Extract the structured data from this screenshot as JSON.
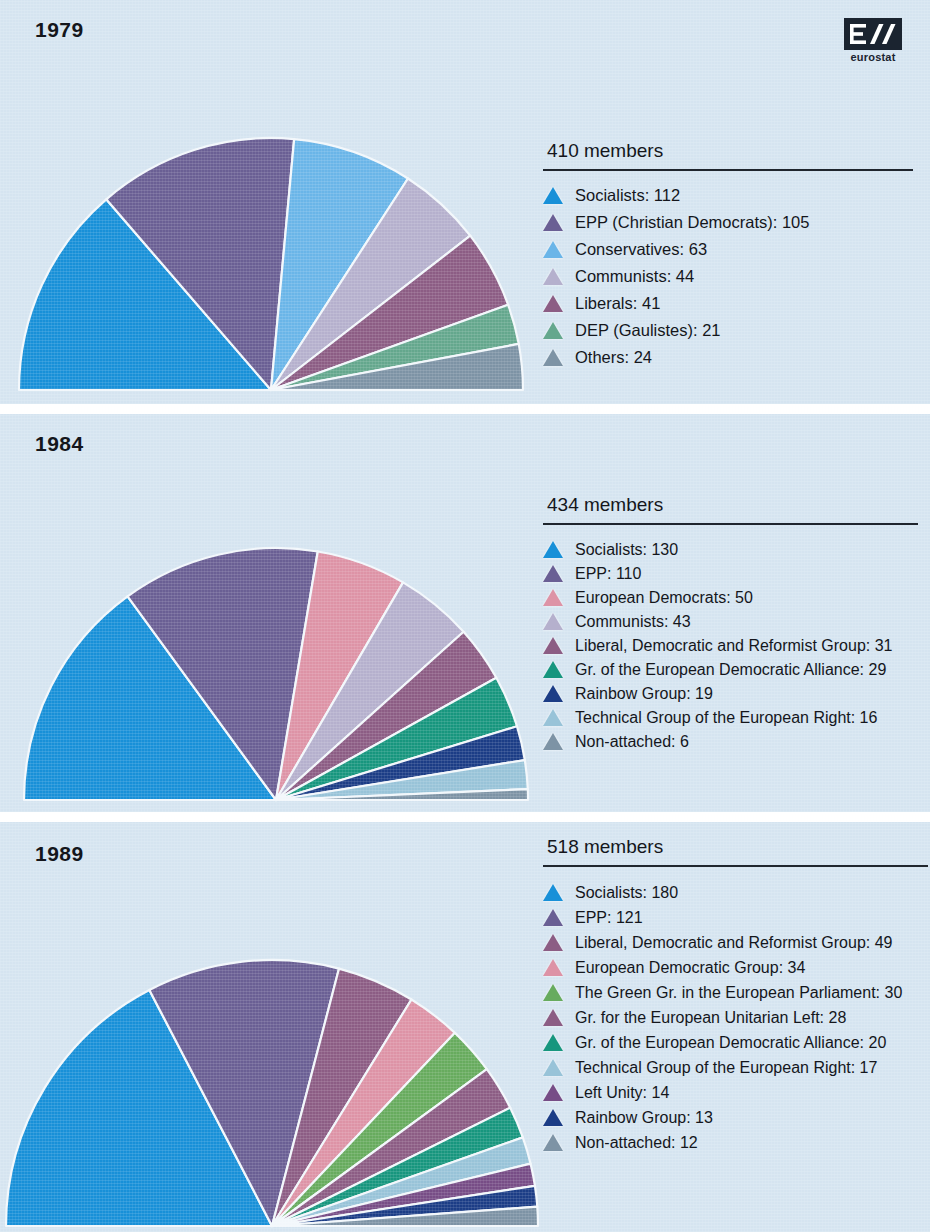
{
  "page": {
    "background": "#d5e4f0",
    "text_color": "#14161c",
    "logo": {
      "name": "eurostat-logo",
      "word": "eurostat"
    }
  },
  "panels": [
    {
      "year": "1979",
      "members_label": "410 members",
      "show_logo": true,
      "chart_data": {
        "type": "pie",
        "title": "1979",
        "subtitle": "410 members",
        "half_circle": true,
        "total": 410,
        "categories": [
          "Socialists",
          "EPP (Christian Democrats)",
          "Conservatives",
          "Communists",
          "Liberals",
          "DEP (Gaulistes)",
          "Others"
        ],
        "values": [
          112,
          105,
          63,
          44,
          41,
          21,
          24
        ],
        "colors": [
          "#1890d8",
          "#6a5f94",
          "#6ab5e8",
          "#b5b0cd",
          "#8c5d84",
          "#64a78d",
          "#7d93a5"
        ],
        "legend_position": "right"
      },
      "legend": [
        {
          "color": "#1890d8",
          "label": "Socialists: 112"
        },
        {
          "color": "#6a5f94",
          "label": "EPP (Christian Democrats): 105"
        },
        {
          "color": "#6ab5e8",
          "label": "Conservatives: 63"
        },
        {
          "color": "#b5b0cd",
          "label": "Communists: 44"
        },
        {
          "color": "#8c5d84",
          "label": "Liberals: 41"
        },
        {
          "color": "#64a78d",
          "label": "DEP (Gaulistes): 21"
        },
        {
          "color": "#7d93a5",
          "label": "Others: 24"
        }
      ]
    },
    {
      "year": "1984",
      "members_label": "434 members",
      "show_logo": false,
      "chart_data": {
        "type": "pie",
        "title": "1984",
        "subtitle": "434 members",
        "half_circle": true,
        "total": 434,
        "categories": [
          "Socialists",
          "EPP",
          "European Democrats",
          "Communists",
          "Liberal, Democratic and Reformist Group",
          "Gr. of the European Democratic Alliance",
          "Rainbow Group",
          "Technical Group of the European Right",
          "Non-attached"
        ],
        "values": [
          130,
          110,
          50,
          43,
          31,
          29,
          19,
          16,
          6
        ],
        "colors": [
          "#1890d8",
          "#6a5f94",
          "#dd93a6",
          "#b5b0cd",
          "#8c5d84",
          "#17967e",
          "#1c3d86",
          "#98c3d8",
          "#7d93a5"
        ],
        "legend_position": "right"
      },
      "legend": [
        {
          "color": "#1890d8",
          "label": "Socialists: 130"
        },
        {
          "color": "#6a5f94",
          "label": "EPP: 110"
        },
        {
          "color": "#dd93a6",
          "label": "European Democrats: 50"
        },
        {
          "color": "#b5b0cd",
          "label": "Communists: 43"
        },
        {
          "color": "#8c5d84",
          "label": "Liberal, Democratic and Reformist Group: 31"
        },
        {
          "color": "#17967e",
          "label": "Gr. of the European Democratic Alliance: 29"
        },
        {
          "color": "#1c3d86",
          "label": "Rainbow Group: 19"
        },
        {
          "color": "#98c3d8",
          "label": "Technical Group of the European Right: 16"
        },
        {
          "color": "#7d93a5",
          "label": "Non-attached: 6"
        }
      ]
    },
    {
      "year": "1989",
      "members_label": "518 members",
      "show_logo": false,
      "chart_data": {
        "type": "pie",
        "title": "1989",
        "subtitle": "518 members",
        "half_circle": true,
        "total": 518,
        "categories": [
          "Socialists",
          "EPP",
          "Liberal, Democratic and Reformist Group",
          "European Democratic Group",
          "The Green Gr. in the European Parliament",
          "Gr. for the European Unitarian Left",
          "Gr. of the European Democratic Alliance",
          "Technical Group of the European Right",
          "Left Unity",
          "Rainbow Group",
          "Non-attached"
        ],
        "values": [
          180,
          121,
          49,
          34,
          30,
          28,
          20,
          17,
          14,
          13,
          12
        ],
        "colors": [
          "#1890d8",
          "#6a5f94",
          "#8c5d84",
          "#dd93a6",
          "#67ab5e",
          "#8c5d84",
          "#17967e",
          "#98c3d8",
          "#774d86",
          "#1c3d86",
          "#7d93a5"
        ],
        "legend_position": "right"
      },
      "legend": [
        {
          "color": "#1890d8",
          "label": "Socialists: 180"
        },
        {
          "color": "#6a5f94",
          "label": "EPP: 121"
        },
        {
          "color": "#8c5d84",
          "label": "Liberal, Democratic and Reformist Group: 49"
        },
        {
          "color": "#dd93a6",
          "label": "European Democratic Group: 34"
        },
        {
          "color": "#67ab5e",
          "label": "The Green Gr. in the European Parliament: 30"
        },
        {
          "color": "#8c5d84",
          "label": "Gr. for the European Unitarian Left: 28"
        },
        {
          "color": "#17967e",
          "label": "Gr. of the European Democratic Alliance: 20"
        },
        {
          "color": "#98c3d8",
          "label": "Technical Group of the European Right: 17"
        },
        {
          "color": "#774d86",
          "label": "Left Unity: 14"
        },
        {
          "color": "#1c3d86",
          "label": "Rainbow Group: 13"
        },
        {
          "color": "#7d93a5",
          "label": "Non-attached: 12"
        }
      ]
    }
  ]
}
